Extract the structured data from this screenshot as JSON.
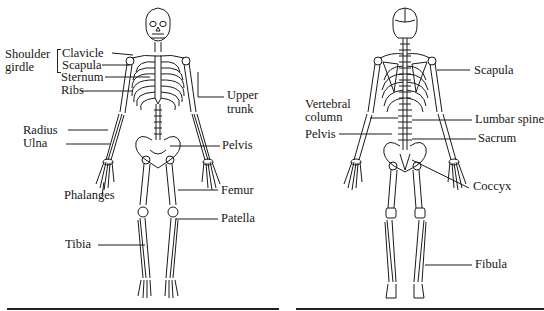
{
  "figure": {
    "panels": [
      {
        "id": "anterior",
        "view": "front",
        "labels": {
          "shoulder_girdle_1": "Shoulder",
          "shoulder_girdle_2": "girdle",
          "clavicle": "Clavicle",
          "scapula": "Scapula",
          "sternum": "Sternum",
          "ribs": "Ribs",
          "upper_trunk_1": "Upper",
          "upper_trunk_2": "trunk",
          "radius": "Radius",
          "ulna": "Ulna",
          "pelvis": "Pelvis",
          "phalanges": "Phalanges",
          "femur": "Femur",
          "patella": "Patella",
          "tibia": "Tibia"
        }
      },
      {
        "id": "posterior",
        "view": "back",
        "labels": {
          "scapula": "Scapula",
          "vertebral_column_1": "Vertebral",
          "vertebral_column_2": "column",
          "lumbar_spine": "Lumbar spine",
          "pelvis": "Pelvis",
          "sacrum": "Sacrum",
          "coccyx": "Coccyx",
          "fibula": "Fibula"
        }
      }
    ],
    "colors": {
      "ink": "#161616",
      "background": "#ffffff"
    }
  }
}
